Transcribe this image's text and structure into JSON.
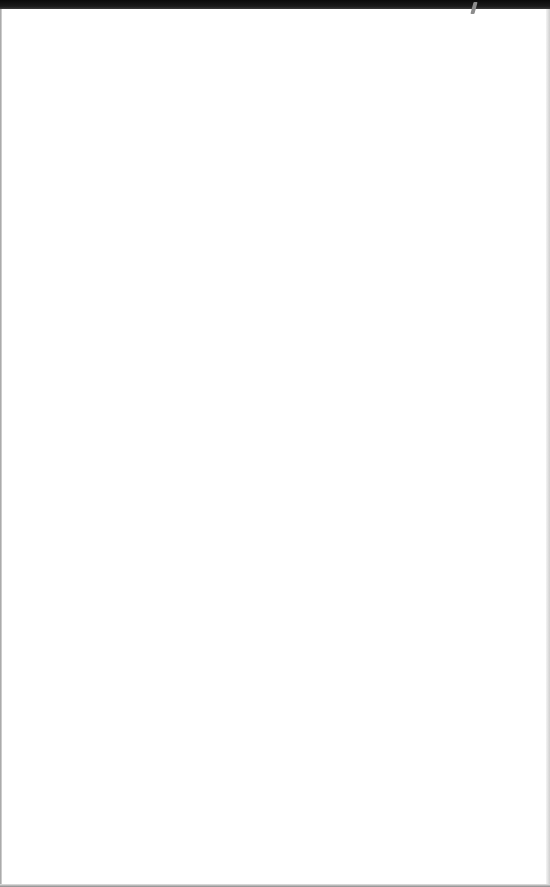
{
  "document": {
    "type": "blank scanned page",
    "text": "",
    "colors": {
      "paper": "#ffffff",
      "top_edge": "#111111",
      "edge_shadow": "#9a9a9a",
      "mark": "#8c8c8c"
    }
  }
}
